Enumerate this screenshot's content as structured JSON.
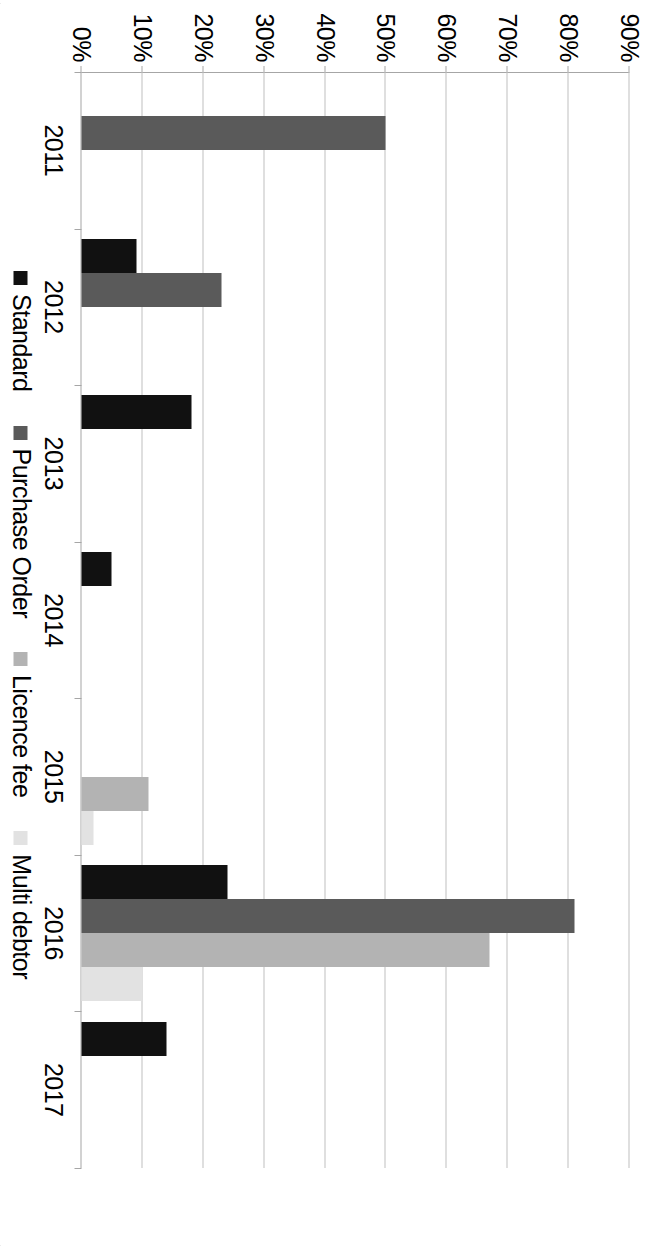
{
  "chart_data": {
    "type": "bar",
    "title": "",
    "subtitle": "",
    "xlabel": "",
    "ylabel": "",
    "orientation": "rotated-90",
    "grid": true,
    "legend_position": "bottom",
    "ylim": [
      0,
      90
    ],
    "ytick_labels": [
      "90%",
      "80%",
      "70%",
      "60%",
      "50%",
      "40%",
      "30%",
      "20%",
      "10%",
      "0%"
    ],
    "ytick_values": [
      90,
      80,
      70,
      60,
      50,
      40,
      30,
      20,
      10,
      0
    ],
    "categories": [
      "2011",
      "2012",
      "2013",
      "2014",
      "2015",
      "2016",
      "2017"
    ],
    "series": [
      {
        "name": "Standard",
        "color": "#111111",
        "values": [
          0,
          9,
          18,
          5,
          0,
          24,
          14
        ]
      },
      {
        "name": "Purchase Order",
        "color": "#5a5a5a",
        "values": [
          50,
          23,
          0,
          0,
          0,
          81,
          0
        ]
      },
      {
        "name": "Licence fee",
        "color": "#b3b3b3",
        "values": [
          0,
          0,
          0,
          0,
          11,
          67,
          0
        ]
      },
      {
        "name": "Multi debtor",
        "color": "#e2e2e2",
        "values": [
          0,
          0,
          0,
          0,
          2,
          10,
          0
        ]
      }
    ]
  },
  "legend": {
    "items": [
      {
        "label": "Standard"
      },
      {
        "label": "Purchase Order"
      },
      {
        "label": "Licence fee"
      },
      {
        "label": "Multi debtor"
      }
    ]
  }
}
